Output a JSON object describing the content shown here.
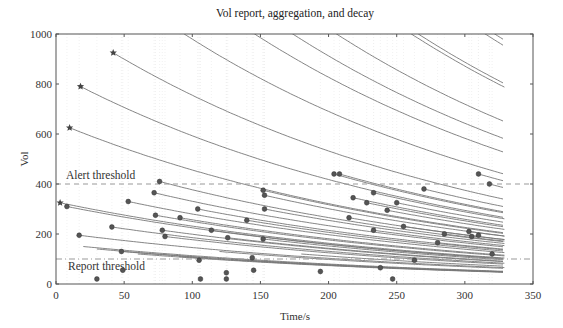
{
  "chart_data": {
    "type": "line",
    "title": "Vol report, aggregation, and decay",
    "xlabel": "Time/s",
    "ylabel": "Vol",
    "xlim": [
      0,
      350
    ],
    "ylim": [
      0,
      1000
    ],
    "xticks": [
      0,
      50,
      100,
      150,
      200,
      250,
      300,
      350
    ],
    "yticks": [
      0,
      200,
      400,
      600,
      800,
      1000
    ],
    "grid": false,
    "decay_rate_per_s": 0.0035,
    "end_time": 329,
    "thresholds": [
      {
        "name": "Alert threshold",
        "value": 400,
        "style": "dashed"
      },
      {
        "name": "Report threshold",
        "value": 100,
        "style": "dash-dot"
      }
    ],
    "aggregation_stars": [
      {
        "x": 3,
        "y": 325
      },
      {
        "x": 10,
        "y": 625
      },
      {
        "x": 18,
        "y": 790
      },
      {
        "x": 42,
        "y": 925
      }
    ],
    "report_points": [
      {
        "x": 8,
        "y": 310
      },
      {
        "x": 17,
        "y": 195
      },
      {
        "x": 30,
        "y": 20
      },
      {
        "x": 41,
        "y": 228
      },
      {
        "x": 48,
        "y": 130
      },
      {
        "x": 49,
        "y": 55
      },
      {
        "x": 53,
        "y": 330
      },
      {
        "x": 72,
        "y": 365
      },
      {
        "x": 73,
        "y": 275
      },
      {
        "x": 76,
        "y": 410
      },
      {
        "x": 78,
        "y": 215
      },
      {
        "x": 80,
        "y": 190
      },
      {
        "x": 91,
        "y": 265
      },
      {
        "x": 104,
        "y": 300
      },
      {
        "x": 105,
        "y": 95
      },
      {
        "x": 106,
        "y": 20
      },
      {
        "x": 114,
        "y": 215
      },
      {
        "x": 125,
        "y": 45
      },
      {
        "x": 125,
        "y": 20
      },
      {
        "x": 126,
        "y": 185
      },
      {
        "x": 140,
        "y": 255
      },
      {
        "x": 144,
        "y": 105
      },
      {
        "x": 145,
        "y": 55
      },
      {
        "x": 152,
        "y": 375
      },
      {
        "x": 153,
        "y": 355
      },
      {
        "x": 153,
        "y": 300
      },
      {
        "x": 152,
        "y": 180
      },
      {
        "x": 194,
        "y": 50
      },
      {
        "x": 204,
        "y": 440
      },
      {
        "x": 208,
        "y": 440
      },
      {
        "x": 215,
        "y": 265
      },
      {
        "x": 218,
        "y": 345
      },
      {
        "x": 228,
        "y": 325
      },
      {
        "x": 233,
        "y": 365
      },
      {
        "x": 233,
        "y": 215
      },
      {
        "x": 238,
        "y": 65
      },
      {
        "x": 243,
        "y": 295
      },
      {
        "x": 247,
        "y": 20
      },
      {
        "x": 250,
        "y": 325
      },
      {
        "x": 255,
        "y": 230
      },
      {
        "x": 263,
        "y": 95
      },
      {
        "x": 270,
        "y": 380
      },
      {
        "x": 280,
        "y": 165
      },
      {
        "x": 285,
        "y": 200
      },
      {
        "x": 303,
        "y": 210
      },
      {
        "x": 305,
        "y": 190
      },
      {
        "x": 310,
        "y": 440
      },
      {
        "x": 310,
        "y": 195
      },
      {
        "x": 318,
        "y": 400
      },
      {
        "x": 320,
        "y": 120
      }
    ],
    "decay_curves_start": [
      {
        "x": 3,
        "y": 325
      },
      {
        "x": 8,
        "y": 310
      },
      {
        "x": 10,
        "y": 625
      },
      {
        "x": 17,
        "y": 195
      },
      {
        "x": 18,
        "y": 790
      },
      {
        "x": 41,
        "y": 228
      },
      {
        "x": 42,
        "y": 925
      },
      {
        "x": 48,
        "y": 130
      },
      {
        "x": 53,
        "y": 330
      },
      {
        "x": 72,
        "y": 365
      },
      {
        "x": 73,
        "y": 275
      },
      {
        "x": 76,
        "y": 410
      },
      {
        "x": 78,
        "y": 215
      },
      {
        "x": 80,
        "y": 190
      },
      {
        "x": 91,
        "y": 265
      },
      {
        "x": 104,
        "y": 300
      },
      {
        "x": 114,
        "y": 215
      },
      {
        "x": 126,
        "y": 185
      },
      {
        "x": 140,
        "y": 255
      },
      {
        "x": 152,
        "y": 375
      },
      {
        "x": 153,
        "y": 355
      },
      {
        "x": 153,
        "y": 300
      },
      {
        "x": 152,
        "y": 180
      },
      {
        "x": 204,
        "y": 440
      },
      {
        "x": 208,
        "y": 440
      },
      {
        "x": 215,
        "y": 265
      },
      {
        "x": 218,
        "y": 345
      },
      {
        "x": 228,
        "y": 325
      },
      {
        "x": 233,
        "y": 365
      },
      {
        "x": 233,
        "y": 215
      },
      {
        "x": 243,
        "y": 295
      },
      {
        "x": 250,
        "y": 325
      },
      {
        "x": 255,
        "y": 230
      },
      {
        "x": 270,
        "y": 380
      },
      {
        "x": 280,
        "y": 165
      },
      {
        "x": 285,
        "y": 200
      },
      {
        "x": 303,
        "y": 210
      },
      {
        "x": 310,
        "y": 440
      },
      {
        "x": 318,
        "y": 400
      },
      {
        "x": 42,
        "y": 1200
      },
      {
        "x": 60,
        "y": 1350
      },
      {
        "x": 90,
        "y": 1500
      },
      {
        "x": 110,
        "y": 1250
      },
      {
        "x": 150,
        "y": 1500
      },
      {
        "x": 175,
        "y": 1350
      },
      {
        "x": 200,
        "y": 1600
      },
      {
        "x": 225,
        "y": 1450
      },
      {
        "x": 240,
        "y": 1300
      },
      {
        "x": 260,
        "y": 1400
      },
      {
        "x": 278,
        "y": 1250
      },
      {
        "x": 290,
        "y": 1150
      },
      {
        "x": 300,
        "y": 1080
      },
      {
        "x": 20,
        "y": 150
      },
      {
        "x": 30,
        "y": 140
      },
      {
        "x": 60,
        "y": 120
      },
      {
        "x": 90,
        "y": 110
      },
      {
        "x": 120,
        "y": 130
      },
      {
        "x": 180,
        "y": 120
      }
    ]
  }
}
